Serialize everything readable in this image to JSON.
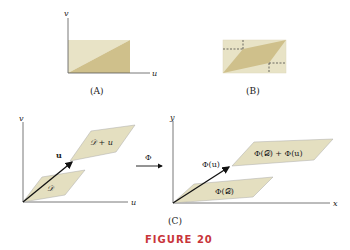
{
  "figure": {
    "caption": "FIGURE 20",
    "caption_color": "#c8353a"
  },
  "colors": {
    "fill_light": "#e8e3c6",
    "fill_dark": "#cfc08b",
    "parallelogram_fill": "#e4dfc0",
    "axis": "#555555",
    "dashed": "#333333"
  },
  "panel_a": {
    "label": "(A)",
    "axis_x": "u",
    "axis_y": "v"
  },
  "panel_b": {
    "label": "(B)"
  },
  "panel_c": {
    "label": "(C)",
    "left": {
      "axis_x": "u",
      "axis_y": "v",
      "vector_label": "u",
      "region_label": "𝒟",
      "translated_region_label": "𝒟 + u"
    },
    "map_label": "Φ",
    "right": {
      "axis_x": "x",
      "axis_y": "y",
      "vector_label": "Φ(u)",
      "region_label": "Φ(𝒟)",
      "translated_region_label": "Φ(𝒟) + Φ(u)"
    }
  }
}
